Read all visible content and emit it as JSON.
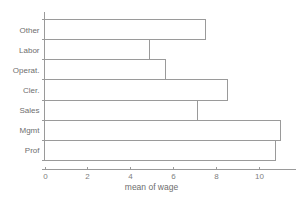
{
  "chart_data": {
    "type": "bar",
    "orientation": "horizontal",
    "title": "",
    "subtitle": "",
    "xlabel": "mean of wage",
    "ylabel": "",
    "categories": [
      "Other",
      "Labor",
      "Operat.",
      "Cler.",
      "Sales",
      "Mgmt",
      "Prof"
    ],
    "values": [
      7.5,
      4.9,
      5.65,
      8.5,
      7.1,
      11.0,
      10.75
    ],
    "series": [
      {
        "name": "mean of wage",
        "values": [
          7.5,
          4.9,
          5.65,
          8.5,
          7.1,
          11.0,
          10.75
        ]
      }
    ],
    "xlim": [
      0,
      11.35
    ],
    "xticks": [
      0,
      2,
      4,
      6,
      8,
      10
    ],
    "xtick_labels": [
      "0",
      "2",
      "4",
      "6",
      "8",
      "10"
    ],
    "grid": false,
    "legend": false,
    "legend_position": "none",
    "bar_fill": "none",
    "bar_stroke": "#9a9a9a",
    "axis_color": "#9a9a9a",
    "text_color": "#6e6e6e",
    "background": "#ffffff"
  },
  "axes": {
    "x_axis_label": "mean of wage",
    "y_axis_label": ""
  }
}
